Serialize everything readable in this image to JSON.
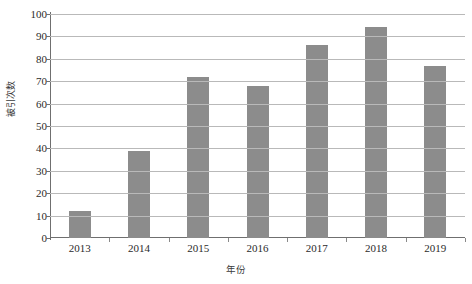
{
  "chart_data": {
    "type": "bar",
    "title": "",
    "subtitle": "",
    "xlabel": "年份",
    "ylabel": "被引次数",
    "categories": [
      "2013",
      "2014",
      "2015",
      "2016",
      "2017",
      "2018",
      "2019"
    ],
    "values": [
      12,
      39,
      72,
      68,
      86,
      94,
      77
    ],
    "series": [
      {
        "name": "被引次数",
        "values": [
          12,
          39,
          72,
          68,
          86,
          94,
          77
        ]
      }
    ],
    "ylim": [
      0,
      100
    ],
    "ytick_labels": [
      "0",
      "10",
      "20",
      "30",
      "40",
      "50",
      "60",
      "70",
      "80",
      "90",
      "100"
    ],
    "ytick_values": [
      0,
      10,
      20,
      30,
      40,
      50,
      60,
      70,
      80,
      90,
      100
    ],
    "grid": "horizontal",
    "legend": "none",
    "annotations": [],
    "colors": {
      "bar": "#8c8c8c",
      "gridline": "#b9b9b9",
      "axis": "#6f6f6f",
      "text": "#2b2b2b",
      "background": "#ffffff"
    }
  }
}
